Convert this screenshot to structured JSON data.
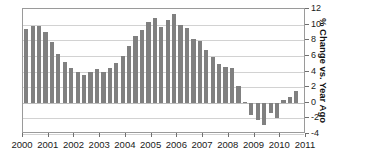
{
  "chart_data": {
    "type": "bar",
    "title": "",
    "subtitle": "",
    "xlabel": "",
    "ylabel": "% Change vs. Year Ago",
    "ylim": [
      -4,
      12
    ],
    "ytick_labels": [
      "12",
      "10",
      "8",
      "6",
      "4",
      "2",
      "0",
      "-2",
      "-4"
    ],
    "ytick_values": [
      12,
      10,
      8,
      6,
      4,
      2,
      0,
      -2,
      -4
    ],
    "xtick_labels": [
      "2000",
      "2001",
      "2002",
      "2003",
      "2004",
      "2005",
      "2006",
      "2007",
      "2008",
      "2009",
      "2010",
      "2011"
    ],
    "xtick_values": [
      2000,
      2001,
      2002,
      2003,
      2004,
      2005,
      2006,
      2007,
      2008,
      2009,
      2010,
      2011
    ],
    "xlim": [
      2000,
      2011
    ],
    "grid": true,
    "grid_orientation": "horizontal",
    "legend": false,
    "legend_position": "none",
    "bar_color": "#808080",
    "frame_color": "#9a9a9a",
    "gridline_color": "#d2d2d2",
    "series_name": "% Change vs. Year Ago",
    "x": [
      2000.0,
      2000.25,
      2000.5,
      2000.75,
      2001.0,
      2001.25,
      2001.5,
      2001.75,
      2002.0,
      2002.25,
      2002.5,
      2002.75,
      2003.0,
      2003.25,
      2003.5,
      2003.75,
      2004.0,
      2004.25,
      2004.5,
      2004.75,
      2005.0,
      2005.25,
      2005.5,
      2005.75,
      2006.0,
      2006.25,
      2006.5,
      2006.75,
      2007.0,
      2007.25,
      2007.5,
      2007.75,
      2008.0,
      2008.25,
      2008.5,
      2008.75,
      2009.0,
      2009.25,
      2009.5,
      2009.75,
      2010.0,
      2010.25,
      2010.5
    ],
    "values": [
      9.4,
      9.8,
      9.8,
      9.1,
      7.8,
      6.3,
      5.2,
      4.4,
      3.9,
      3.6,
      4.0,
      4.3,
      4.0,
      4.4,
      5.1,
      6.0,
      7.3,
      8.5,
      9.3,
      10.3,
      10.9,
      9.7,
      10.6,
      11.3,
      10.0,
      9.6,
      8.1,
      7.9,
      6.7,
      5.8,
      4.9,
      4.6,
      4.5,
      2.2,
      0.1,
      -1.6,
      -2.2,
      -2.8,
      -1.3,
      -1.9,
      0.4,
      0.7,
      1.5
    ]
  }
}
